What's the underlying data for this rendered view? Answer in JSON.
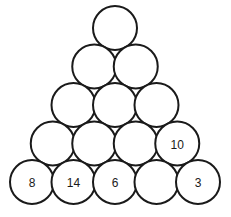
{
  "figure": {
    "background_color": "#ffffff",
    "stroke_color": "#1a1a1a",
    "text_color": "#1a1a1a",
    "stroke_width": 2,
    "radius": 22,
    "h_spacing": 41.5,
    "v_spacing": 38.5,
    "apex_cx": 115,
    "apex_cy": 28
  },
  "chart_data": {
    "type": "diagram",
    "rows": [
      {
        "row": 1,
        "count": 1,
        "cy": 28,
        "circles": [
          {
            "index": 0,
            "cx": 115,
            "label": ""
          }
        ]
      },
      {
        "row": 2,
        "count": 2,
        "cy": 66.5,
        "circles": [
          {
            "index": 0,
            "cx": 94.25,
            "label": ""
          },
          {
            "index": 1,
            "cx": 135.75,
            "label": ""
          }
        ]
      },
      {
        "row": 3,
        "count": 3,
        "cy": 105,
        "circles": [
          {
            "index": 0,
            "cx": 73.5,
            "label": ""
          },
          {
            "index": 1,
            "cx": 115,
            "label": ""
          },
          {
            "index": 2,
            "cx": 156.5,
            "label": ""
          }
        ]
      },
      {
        "row": 4,
        "count": 4,
        "cy": 143.5,
        "circles": [
          {
            "index": 0,
            "cx": 52.75,
            "label": ""
          },
          {
            "index": 1,
            "cx": 94.25,
            "label": ""
          },
          {
            "index": 2,
            "cx": 135.75,
            "label": ""
          },
          {
            "index": 3,
            "cx": 177.25,
            "label": "10"
          }
        ]
      },
      {
        "row": 5,
        "count": 5,
        "cy": 182,
        "circles": [
          {
            "index": 0,
            "cx": 32,
            "label": "8"
          },
          {
            "index": 1,
            "cx": 73.5,
            "label": "14"
          },
          {
            "index": 2,
            "cx": 115,
            "label": "6"
          },
          {
            "index": 3,
            "cx": 156.5,
            "label": ""
          },
          {
            "index": 4,
            "cx": 198,
            "label": "3"
          }
        ]
      }
    ],
    "labels_present": [
      "10",
      "8",
      "14",
      "6",
      "3"
    ]
  }
}
